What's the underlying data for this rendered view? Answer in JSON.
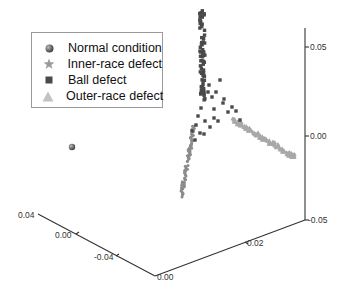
{
  "chart_data": {
    "type": "scatter",
    "projection": "3d",
    "title": "",
    "xlabel": "",
    "ylabel": "",
    "zlabel": "",
    "axes": {
      "x": {
        "ticks": [
          "0.04",
          "0.00",
          "-0.04"
        ],
        "range": [
          -0.06,
          0.04
        ]
      },
      "y": {
        "ticks": [
          "0.00",
          "0.02"
        ],
        "range": [
          0.0,
          0.04
        ]
      },
      "z": {
        "ticks": [
          "0.05",
          "0.00",
          "-0.05"
        ],
        "range": [
          -0.05,
          0.06
        ]
      }
    },
    "grid": false,
    "legend_position": "upper-left",
    "series": [
      {
        "name": "Normal condition",
        "marker": "sphere",
        "color": "#6e6e6e",
        "description": "single isolated point far left",
        "points_2d": [
          [
            72,
            147
          ]
        ]
      },
      {
        "name": "Inner-race defect",
        "marker": "star",
        "color": "#8c8c8c",
        "description": "dense linear cluster on lower-left arm",
        "arm": {
          "from": [
            181,
            196
          ],
          "to": [
            194,
            127
          ]
        }
      },
      {
        "name": "Ball defect",
        "marker": "square",
        "color": "#4a4a4a",
        "description": "vertical column of points at top plus scattered points toward center",
        "arm": {
          "from": [
            202,
            12
          ],
          "to": [
            203,
            100
          ]
        }
      },
      {
        "name": "Outer-race defect",
        "marker": "triangle",
        "color": "#a8a8a8",
        "description": "dense linear cluster on right arm descending to the right",
        "arm": {
          "from": [
            233,
            120
          ],
          "to": [
            296,
            158
          ]
        }
      }
    ]
  },
  "legend": {
    "items": [
      {
        "label": "Normal condition",
        "marker": "sphere-icon"
      },
      {
        "label": "Inner-race defect",
        "marker": "star-icon"
      },
      {
        "label": "Ball defect",
        "marker": "square-icon"
      },
      {
        "label": "Outer-race defect",
        "marker": "triangle-icon"
      }
    ]
  },
  "axis_labels": {
    "z_top": "0.05",
    "z_mid": "0.00",
    "z_bottom": "-0.05",
    "x_left_1": "0.04",
    "x_left_2": "0.00",
    "x_left_3": "-0.04",
    "origin": "0.00",
    "y_right_1": "0.02"
  }
}
